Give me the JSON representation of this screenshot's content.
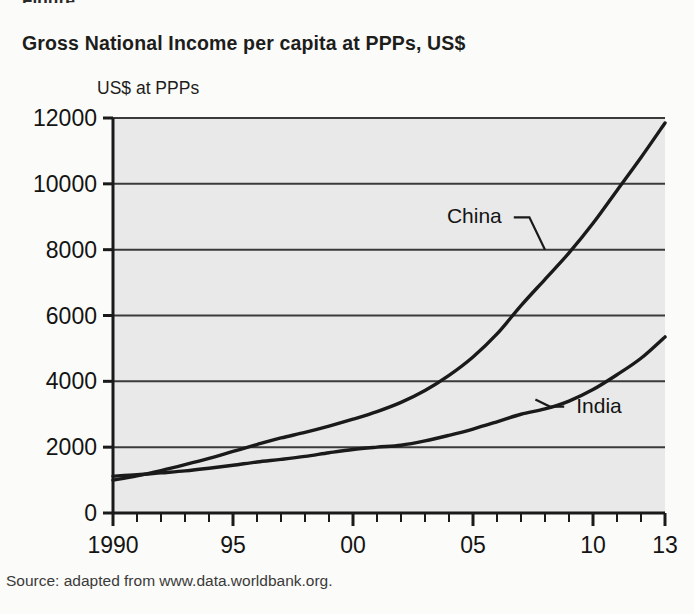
{
  "figure": {
    "cropped_header_fragment": "Figure",
    "title": "Gross National Income per capita at PPPs, US$",
    "source": "Source: adapted from www.data.worldbank.org.",
    "plot_background": "#e9e9e9",
    "line_color": "#1a1a1a",
    "grid_color": "#3a3a3a"
  },
  "chart_data": {
    "type": "line",
    "title": "Gross National Income per capita at PPPs, US$",
    "subtitle": "",
    "xlabel": "",
    "ylabel": "US$ at PPPs",
    "ylim": [
      0,
      12000
    ],
    "xlim": [
      1990,
      2013
    ],
    "yticks": [
      0,
      2000,
      4000,
      6000,
      8000,
      10000,
      12000
    ],
    "ytick_labels": [
      "0",
      "2000",
      "4000",
      "6000",
      "8000",
      "10000",
      "12000"
    ],
    "xticks": [
      1990,
      1995,
      2000,
      2005,
      2010,
      2013
    ],
    "xtick_labels": [
      "1990",
      "95",
      "00",
      "05",
      "10",
      "13"
    ],
    "minor_xticks_every": 1,
    "grid": "horizontal",
    "legend": "inline-annotations",
    "annotations": [
      {
        "text": "China",
        "x": 2006.2,
        "y": 8800,
        "points_to_x": 2008.0,
        "points_to_y": 8000
      },
      {
        "text": "India",
        "x": 2009.3,
        "y": 3050,
        "points_to_x": 2007.6,
        "points_to_y": 3450
      }
    ],
    "x": [
      1990,
      1991,
      1992,
      1993,
      1994,
      1995,
      1996,
      1997,
      1998,
      1999,
      2000,
      2001,
      2002,
      2003,
      2004,
      2005,
      2006,
      2007,
      2008,
      2009,
      2010,
      2011,
      2012,
      2013
    ],
    "series": [
      {
        "name": "China",
        "values": [
          1000,
          1130,
          1290,
          1470,
          1660,
          1870,
          2080,
          2280,
          2450,
          2640,
          2850,
          3080,
          3360,
          3720,
          4180,
          4740,
          5440,
          6300,
          7100,
          7900,
          8800,
          9800,
          10800,
          11850
        ]
      },
      {
        "name": "India",
        "values": [
          1120,
          1160,
          1220,
          1280,
          1360,
          1450,
          1550,
          1630,
          1720,
          1830,
          1930,
          2000,
          2060,
          2190,
          2360,
          2550,
          2770,
          3000,
          3160,
          3400,
          3750,
          4200,
          4700,
          5350
        ]
      }
    ]
  }
}
